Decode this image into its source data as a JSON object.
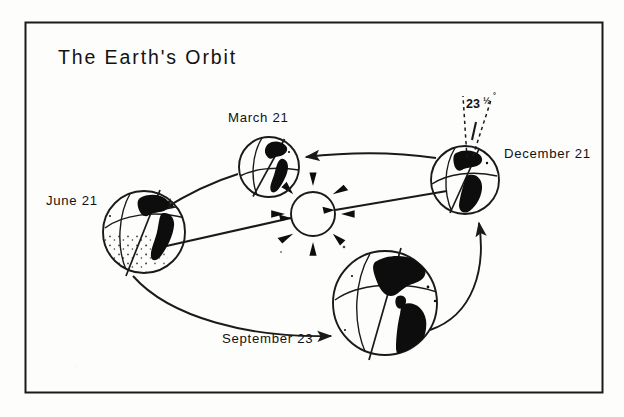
{
  "figure": {
    "title": "The Earth's Orbit",
    "frame": {
      "color": "#1a1a1a"
    },
    "sun": {
      "name": "sun",
      "rays": 8
    },
    "axis_tilt": {
      "value": "23",
      "fraction": "½",
      "degree_symbol": "°",
      "full": "23½°"
    },
    "positions": [
      {
        "id": "march",
        "label": "March 21",
        "name": "globe-march-21",
        "cx": 269,
        "cy": 167,
        "r": 30,
        "label_x": 228,
        "label_y": 122
      },
      {
        "id": "june",
        "label": "June 21",
        "name": "globe-june-21",
        "cx": 144,
        "cy": 232,
        "r": 41,
        "label_x": 46,
        "label_y": 205
      },
      {
        "id": "september",
        "label": "September 23",
        "name": "globe-september-23",
        "cx": 385,
        "cy": 303,
        "r": 52,
        "label_x": 222,
        "label_y": 343
      },
      {
        "id": "december",
        "label": "December 21",
        "name": "globe-december-21",
        "cx": 465,
        "cy": 180,
        "r": 34,
        "label_x": 504,
        "label_y": 158
      }
    ],
    "arrows": [
      {
        "name": "orbit-arrow-march-to-june",
        "from": "march",
        "to": "june"
      },
      {
        "name": "orbit-arrow-june-to-september",
        "from": "june",
        "to": "september"
      },
      {
        "name": "orbit-arrow-september-to-december",
        "from": "september",
        "to": "december"
      },
      {
        "name": "orbit-arrow-december-to-march",
        "from": "december",
        "to": "march"
      }
    ],
    "sun_line": {
      "name": "solstice-axis-line",
      "from": "june",
      "to": "december"
    },
    "colors": {
      "ink": "#1a1a1a",
      "land": "#0d0d0d",
      "paper": "#fdfdfb"
    }
  }
}
